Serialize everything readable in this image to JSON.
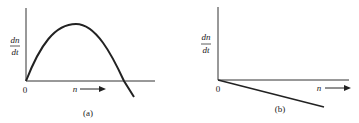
{
  "panels": [
    {
      "id": "a",
      "caption": "(a)",
      "y_label_num": "dn",
      "y_label_den": "dt",
      "origin_label": "0",
      "x_label": "n",
      "curve": "parabola: rises from origin, peaks, crosses x-axis and goes negative"
    },
    {
      "id": "b",
      "caption": "(b)",
      "y_label_num": "dn",
      "y_label_den": "dt",
      "origin_label": "0",
      "x_label": "n",
      "curve": "straight line decreasing from origin (negative slope)"
    }
  ],
  "colors": {
    "ink": "#222222",
    "background": "#ffffff"
  }
}
